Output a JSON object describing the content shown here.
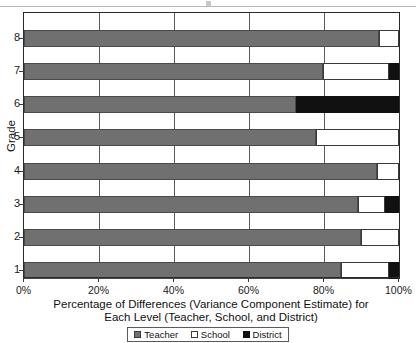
{
  "chart_data": {
    "type": "bar",
    "orientation": "horizontal",
    "stacked": true,
    "normalized": true,
    "title": "",
    "xlabel": "Percentage of Differences (Variance Component Estimate) for Each Level (Teacher, School, and District)",
    "xlabel_line1": "Percentage of Differences (Variance Component Estimate) for",
    "xlabel_line2": "Each Level (Teacher, School, and District)",
    "ylabel": "Grade",
    "categories": [
      "1",
      "2",
      "3",
      "4",
      "5",
      "6",
      "7",
      "8"
    ],
    "xlim": [
      0,
      100
    ],
    "xticks": [
      0,
      20,
      40,
      60,
      80,
      100
    ],
    "xticklabels": [
      "0%",
      "20%",
      "40%",
      "60%",
      "80%",
      "100%"
    ],
    "yticklabels": [
      "1",
      "2",
      "3",
      "4",
      "5",
      "6",
      "7",
      "8"
    ],
    "grid": true,
    "legend_position": "bottom",
    "series": [
      {
        "name": "Teacher",
        "color": "#707070",
        "values": [
          84.5,
          89.9,
          89.1,
          94.1,
          77.9,
          72.5,
          79.7,
          94.7
        ]
      },
      {
        "name": "School",
        "color": "#ffffff",
        "values": [
          12.8,
          10.1,
          7.2,
          5.9,
          22.1,
          0.0,
          17.6,
          5.3
        ]
      },
      {
        "name": "District",
        "color": "#111111",
        "values": [
          2.7,
          0.0,
          3.7,
          0.0,
          0.0,
          27.5,
          2.7,
          0.0
        ]
      }
    ]
  },
  "axes": {
    "y_title": "Grade",
    "x_title_line1": "Percentage of Differences (Variance Component Estimate) for",
    "x_title_line2": "Each Level (Teacher, School, and District)",
    "x_tick_labels": [
      "0%",
      "20%",
      "40%",
      "60%",
      "80%",
      "100%"
    ],
    "y_tick_labels": [
      "8",
      "7",
      "6",
      "5",
      "4",
      "3",
      "2",
      "1"
    ]
  },
  "legend": {
    "items": [
      {
        "label": "Teacher",
        "swatch": "teacher-swatch"
      },
      {
        "label": "School",
        "swatch": "school-swatch"
      },
      {
        "label": "District",
        "swatch": "district-swatch"
      }
    ]
  }
}
